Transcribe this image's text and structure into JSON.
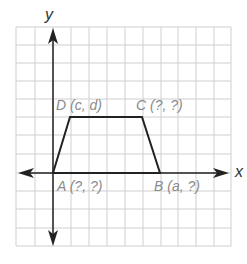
{
  "figure": {
    "type": "coordinate-plane-trapezoid",
    "axes": {
      "x_label": "x",
      "y_label": "y"
    },
    "grid": {
      "columns": 12,
      "rows": 12,
      "line_color": "#c8c8c8"
    },
    "shape": "trapezoid ABCD",
    "vertices": {
      "A": {
        "label": "A (?, ?)",
        "grid": [
          0,
          0
        ]
      },
      "B": {
        "label": "B (a, ?)",
        "grid": [
          6,
          0
        ]
      },
      "C": {
        "label": "C (?, ?)",
        "grid": [
          5,
          3
        ]
      },
      "D": {
        "label": "D (c, d)",
        "grid": [
          1,
          3
        ]
      }
    },
    "colors": {
      "shape_stroke": "#222222",
      "axis": "#222222",
      "label_text": "#8a8a8a"
    }
  }
}
